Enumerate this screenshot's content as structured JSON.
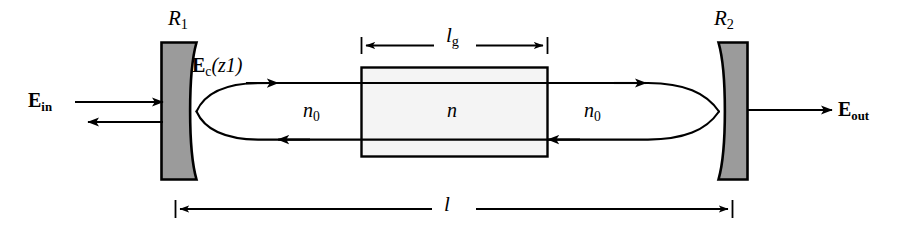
{
  "figure": {
    "kind": "optical-cavity-diagram",
    "width": 912,
    "height": 234,
    "background_color": "#ffffff",
    "line_color": "#000000",
    "mirror_fill_color": "#9b9b9b",
    "medium_fill_color": "#f4f4f4"
  },
  "labels": {
    "mirror_left": {
      "base": "R",
      "subscript": "1",
      "full": "R1"
    },
    "mirror_right": {
      "base": "R",
      "subscript": "2",
      "full": "R2"
    },
    "cavity_field": {
      "base": "E",
      "subscript": "c",
      "argument": "(z1)",
      "full": "Ec(z1)"
    },
    "input_field": {
      "base": "E",
      "subscript": "in",
      "full": "Ein"
    },
    "output_field": {
      "base": "E",
      "subscript": "out",
      "full": "Eout"
    },
    "index_outside_left": {
      "base": "n",
      "subscript": "0",
      "full": "n0"
    },
    "index_gain": {
      "base": "n",
      "subscript": "",
      "full": "n"
    },
    "index_outside_right": {
      "base": "n",
      "subscript": "0",
      "full": "n0"
    },
    "gain_length": {
      "base": "l",
      "subscript": "g",
      "full": "lg"
    },
    "cavity_length": {
      "base": "l",
      "subscript": "",
      "full": "l"
    }
  },
  "elements": {
    "mirror_left": {
      "name": "left-concave-mirror",
      "x_left": 161,
      "x_right": 196,
      "y_top": 41,
      "y_bottom": 181,
      "curve_side": "right"
    },
    "mirror_right": {
      "name": "right-concave-mirror",
      "x_left": 717,
      "x_right": 748,
      "y_top": 41,
      "y_bottom": 181,
      "curve_side": "left"
    },
    "gain_medium": {
      "name": "gain-medium-block",
      "x_left": 361,
      "x_right": 548,
      "y_top": 67,
      "y_bottom": 157
    },
    "beam_axis_y": 111,
    "beam_upper_y": 83,
    "beam_lower_y": 139,
    "input_arrow_y": 102,
    "reflected_arrow_y": 122,
    "output_arrow_y": 110
  },
  "dimensions": {
    "gain_length_line": {
      "y": 45,
      "x_start": 361,
      "x_end": 548,
      "label": "lg"
    },
    "cavity_length_line": {
      "y": 209,
      "x_start": 175,
      "x_end": 733,
      "label": "l"
    }
  }
}
